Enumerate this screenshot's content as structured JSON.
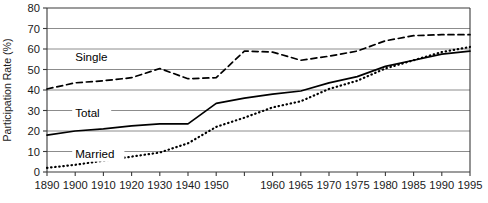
{
  "chart_data": {
    "type": "line",
    "title": "",
    "xlabel": "",
    "ylabel": "Participation Rate (%)",
    "ylim": [
      0,
      80
    ],
    "ytick_step": 10,
    "yticks": [
      "0",
      "10",
      "20",
      "30",
      "40",
      "50",
      "60",
      "70",
      "80"
    ],
    "grid": "horizontal",
    "legend_position": "inline-labels",
    "x": [
      1890,
      1900,
      1910,
      1920,
      1930,
      1940,
      1950,
      1955,
      1960,
      1965,
      1970,
      1975,
      1980,
      1985,
      1990,
      1995
    ],
    "xticks": [
      "1890",
      "1900",
      "1910",
      "1920",
      "1930",
      "1940",
      "1950",
      "1955",
      "1960",
      "1965",
      "1970",
      "1975",
      "1980",
      "1985",
      "1990",
      "1995"
    ],
    "xtick_labels_shown": [
      "1890",
      "1900",
      "1910",
      "1920",
      "1930",
      "1940",
      "1950",
      "1960",
      "1965",
      "1970",
      "1975",
      "1980",
      "1985",
      "1990",
      "1995"
    ],
    "series": [
      {
        "name": "Single",
        "style": "dashed",
        "color": "#000000",
        "label": "Single",
        "values": [
          40.5,
          43.5,
          44.5,
          46.0,
          50.5,
          45.5,
          46.0,
          59.0,
          58.5,
          54.5,
          56.5,
          59.0,
          64.0,
          66.5,
          67.0,
          67.0
        ]
      },
      {
        "name": "Total",
        "style": "solid",
        "color": "#000000",
        "label": "Total",
        "values": [
          18.0,
          20.0,
          21.0,
          22.5,
          23.5,
          23.5,
          33.5,
          36.0,
          38.0,
          39.5,
          43.5,
          46.5,
          51.5,
          54.5,
          57.5,
          59.0
        ]
      },
      {
        "name": "Married",
        "style": "dotted",
        "color": "#000000",
        "label": "Married",
        "values": [
          2.0,
          3.5,
          5.5,
          7.5,
          9.5,
          14.0,
          22.0,
          26.5,
          31.5,
          34.5,
          40.5,
          44.5,
          50.5,
          54.5,
          58.5,
          61.0
        ]
      }
    ],
    "series_label_positions": [
      {
        "name": "Single",
        "x": 1900,
        "y": 54
      },
      {
        "name": "Total",
        "x": 1900,
        "y": 27
      },
      {
        "name": "Married",
        "x": 1900,
        "y": 7
      }
    ]
  }
}
